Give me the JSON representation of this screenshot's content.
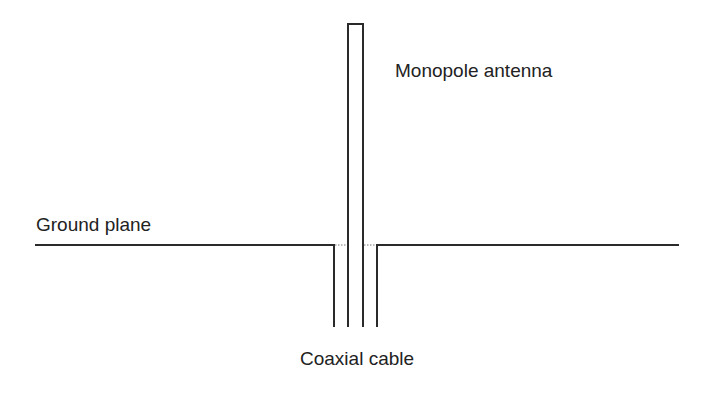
{
  "diagram": {
    "labels": {
      "antenna": "Monopole antenna",
      "ground": "Ground plane",
      "cable": "Coaxial cable"
    },
    "colors": {
      "line": "#2a2a2a",
      "dotted": "#777777",
      "text": "#222222",
      "background": "#ffffff"
    }
  }
}
